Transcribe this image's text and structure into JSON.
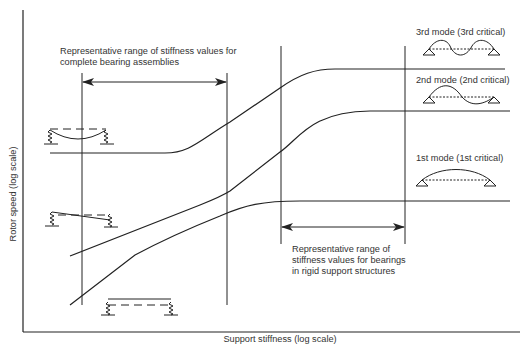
{
  "axes": {
    "y_label": "Rotor speed (log scale)",
    "x_label": "Support stiffness (log scale)"
  },
  "annotations": {
    "bearing_assemblies_range": "Representative range of stiffness values for\ncomplete bearing assemblies",
    "rigid_support_range": "Representative range of\nstiffness values for bearings\nin rigid support structures"
  },
  "modes": [
    {
      "label": "3rd mode (3rd critical)",
      "shape": "full-wave"
    },
    {
      "label": "2nd mode (2nd critical)",
      "shape": "s-wave"
    },
    {
      "label": "1st mode (1st critical)",
      "shape": "half-wave"
    }
  ],
  "rigid_body_modes": [
    {
      "name": "bending-on-springs",
      "shape": "sag"
    },
    {
      "name": "rocking",
      "shape": "tilt"
    },
    {
      "name": "bouncing",
      "shape": "translation"
    }
  ],
  "colors": {
    "line": "#222222",
    "text": "#333333",
    "background": "#ffffff"
  }
}
